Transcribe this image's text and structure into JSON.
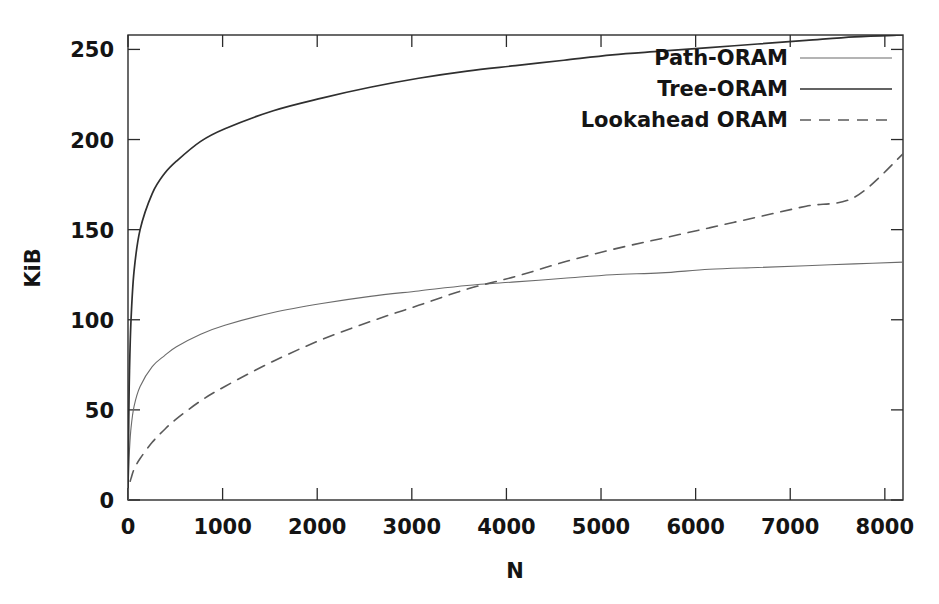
{
  "chart_data": {
    "type": "line",
    "title": "",
    "subtitle": "",
    "xlabel": "N",
    "ylabel": "KiB",
    "xlim": [
      0,
      8192
    ],
    "ylim": [
      0,
      258
    ],
    "grid": false,
    "legend_position": "top-right",
    "xticks": [
      0,
      1000,
      2000,
      3000,
      4000,
      5000,
      6000,
      7000,
      8000
    ],
    "xtick_labels": [
      "0",
      "1000",
      "2000",
      "3000",
      "4000",
      "5000",
      "6000",
      "7000",
      "8000"
    ],
    "yticks": [
      0,
      50,
      100,
      150,
      200,
      250
    ],
    "ytick_labels": [
      "0",
      "50",
      "100",
      "150",
      "200",
      "250"
    ],
    "x": [
      1,
      8,
      16,
      32,
      64,
      128,
      256,
      384,
      512,
      768,
      1024,
      1536,
      2048,
      2560,
      3072,
      3584,
      4096,
      4608,
      5120,
      5632,
      6144,
      6656,
      7168,
      7680,
      8192
    ],
    "series": [
      {
        "name": "Path-ORAM",
        "style": "solid",
        "color": "#6b6b6b",
        "width": 1.1,
        "values": [
          4,
          18,
          28,
          40,
          52,
          63,
          74,
          80,
          85,
          92,
          97,
          104,
          109,
          113,
          116,
          119,
          121,
          123,
          125,
          126,
          128,
          129,
          130,
          131,
          132
        ]
      },
      {
        "name": "Tree-ORAM",
        "style": "solid",
        "color": "#2f2f2f",
        "width": 1.7,
        "values": [
          7,
          45,
          72,
          100,
          127,
          150,
          170,
          181,
          188,
          199,
          206,
          216,
          223,
          229,
          234,
          238,
          241,
          244,
          247,
          249,
          251,
          253,
          255,
          257,
          258
        ]
      },
      {
        "name": "Lookahead ORAM",
        "style": "dashed",
        "color": "#5a5a5a",
        "width": 1.6,
        "values": [
          5,
          7,
          9,
          12,
          17,
          23,
          32,
          39,
          45,
          55,
          63,
          77,
          89,
          99,
          108,
          117,
          124,
          132,
          139,
          145,
          151,
          157,
          163,
          168,
          192
        ]
      }
    ],
    "legend_entries": [
      {
        "label": "Path-ORAM",
        "style": "solid",
        "width": 1.1,
        "color": "#6b6b6b"
      },
      {
        "label": "Tree-ORAM",
        "style": "solid",
        "width": 1.7,
        "color": "#2f2f2f"
      },
      {
        "label": "Lookahead ORAM",
        "style": "dashed",
        "width": 1.6,
        "color": "#5a5a5a"
      }
    ]
  },
  "axes": {
    "x_title": "N",
    "y_title": "KiB"
  }
}
